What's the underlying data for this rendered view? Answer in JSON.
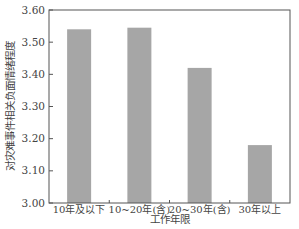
{
  "chart_data": {
    "type": "bar",
    "title": "",
    "xlabel": "工作年限",
    "ylabel": "对灾难事件相关负面情绪程度",
    "categories": [
      "10年及以下",
      "10~20年(含)",
      "20~30年(含)",
      "30年以上"
    ],
    "values": [
      3.54,
      3.545,
      3.42,
      3.18
    ],
    "ylim": [
      3.0,
      3.6
    ],
    "yticks": [
      "3.00",
      "3.10",
      "3.20",
      "3.30",
      "3.40",
      "3.50",
      "3.60"
    ],
    "grid": false,
    "legend": null,
    "bar_color": "#a6a6a6"
  }
}
